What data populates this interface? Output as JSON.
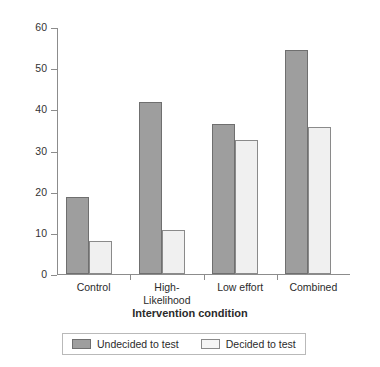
{
  "chart_data": {
    "type": "bar",
    "title": "",
    "xlabel": "Intervention condition",
    "ylabel": "Percentage",
    "categories": [
      "Control",
      "High-\nLikelihood",
      "Low effort",
      "Combined"
    ],
    "category_labels_flat": [
      "Control",
      "High-Likelihood",
      "Low effort",
      "Combined"
    ],
    "series": [
      {
        "name": "Undecided to test",
        "color": "#9e9e9e",
        "border_color": "#6f6f6f",
        "values": [
          18.8,
          41.7,
          36.5,
          54.5
        ]
      },
      {
        "name": "Decided to test",
        "color": "#f0f0f0",
        "border_color": "#8a8a8a",
        "values": [
          8.0,
          10.6,
          32.5,
          35.8
        ]
      }
    ],
    "ylim": [
      0,
      60
    ],
    "yticks": [
      0,
      10,
      20,
      30,
      40,
      50,
      60
    ],
    "ytick_labels": [
      "0",
      "10",
      "20",
      "30",
      "40",
      "50",
      "60"
    ],
    "grid": false,
    "legend_position": "bottom"
  },
  "axes": {
    "y_title": "Percentage",
    "x_title": "Intervention condition"
  },
  "legend": {
    "entries": [
      {
        "label": "Undecided to test",
        "swatch": "dark"
      },
      {
        "label": "Decided to test",
        "swatch": "light"
      }
    ]
  }
}
